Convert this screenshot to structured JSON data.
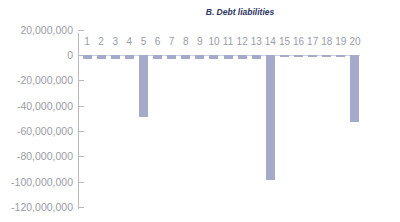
{
  "chart_data": {
    "type": "bar",
    "title": "B. Debt liabilities",
    "xlabel": "",
    "ylabel": "",
    "categories": [
      "1",
      "2",
      "3",
      "4",
      "5",
      "6",
      "7",
      "8",
      "9",
      "10",
      "11",
      "12",
      "13",
      "14",
      "15",
      "16",
      "17",
      "18",
      "19",
      "20"
    ],
    "values": [
      -3500000,
      -3500000,
      -3500000,
      -3500000,
      -49000000,
      -3000000,
      -3000000,
      -3000000,
      -3000000,
      -3000000,
      -3000000,
      -3000000,
      -3000000,
      -99000000,
      -1500000,
      -1500000,
      -1500000,
      -1500000,
      -1500000,
      -53000000
    ],
    "ylim": [
      -120000000,
      20000000
    ],
    "yticks": [
      "20,000,000",
      "0",
      "-20,000,000",
      "-40,000,000",
      "-60,000,000",
      "-80,000,000",
      "-100,000,000",
      "-120,000,000"
    ],
    "grid": false,
    "legend": null,
    "bar_color": "#a5aacb"
  }
}
